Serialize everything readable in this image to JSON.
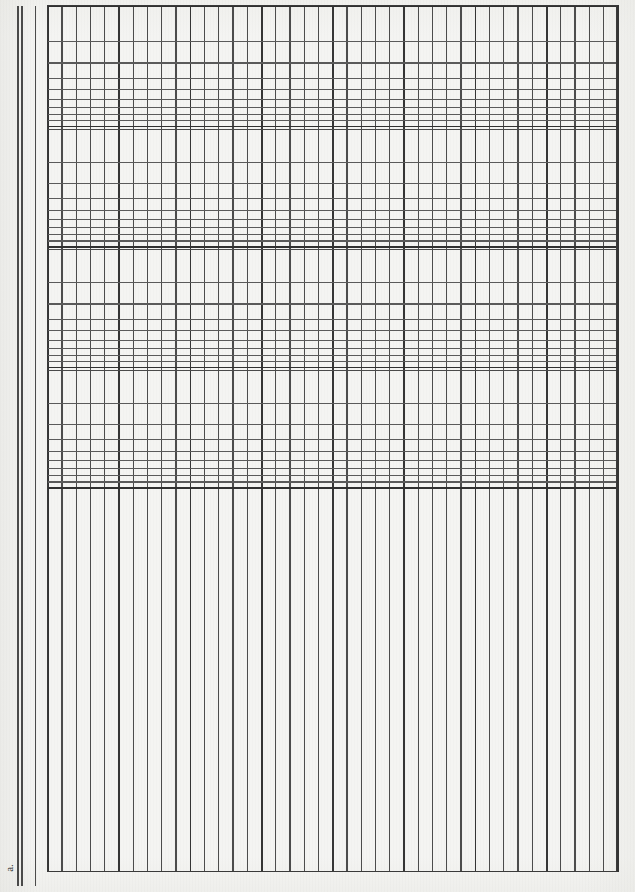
{
  "document": {
    "kind": "scanned-graph-paper",
    "paper_type": "semi-logarithmic graph paper",
    "corner_label": "a.",
    "background_color": "#f4f4f2",
    "rule_color": "#4c4c4c",
    "heavy_rule_color": "#303030",
    "page_width": 635,
    "page_height": 892
  },
  "margin": {
    "rules": [
      {
        "name": "outer-rule-a",
        "x": 17
      },
      {
        "name": "outer-rule-b",
        "x": 21
      },
      {
        "name": "inner-rule",
        "x": 35
      }
    ]
  },
  "chart_data": {
    "type": "table",
    "title": "",
    "subtitle": "",
    "xlabel": "",
    "ylabel": "",
    "grid": true,
    "legend": "none",
    "x_axis": {
      "scale": "linear",
      "tick_count": 41,
      "major_every": 5,
      "range_px": [
        0,
        570
      ],
      "tick_labels": []
    },
    "y_axis": {
      "scale": "log10",
      "decades": 4,
      "decade_boundaries_px": [
        0,
        120.5,
        241,
        361.5,
        482
      ],
      "minor_multipliers": [
        2,
        3,
        4,
        5,
        6,
        7,
        8,
        9
      ],
      "tick_labels": []
    },
    "log_band": {
      "top_px": 0,
      "height_px": 482
    },
    "linear_band": {
      "top_px": 482,
      "height_px": 385
    },
    "categories": [],
    "values": [],
    "series": []
  }
}
